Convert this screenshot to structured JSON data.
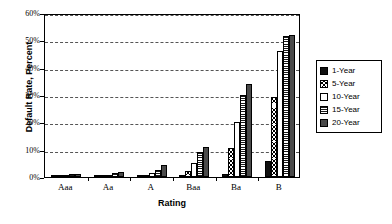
{
  "chart_data": {
    "type": "bar",
    "title": "",
    "xlabel": "Rating",
    "ylabel": "Default Rate, Percent",
    "categories": [
      "Aaa",
      "Aa",
      "A",
      "Baa",
      "Ba",
      "B"
    ],
    "ylim": [
      0,
      60
    ],
    "ytick_labels": [
      "0%",
      "10%",
      "20%",
      "30%",
      "40%",
      "50%",
      "60%"
    ],
    "ytick_values": [
      0,
      10,
      20,
      30,
      40,
      50,
      60
    ],
    "grid": "horizontal-dashed",
    "legend_position": "right",
    "series": [
      {
        "name": "1-Year",
        "pattern": "solid-black",
        "color": "#111111",
        "values": [
          0.0,
          0.0,
          0.1,
          0.2,
          1.2,
          5.8
        ]
      },
      {
        "name": "5-Year",
        "pattern": "cross-hatch",
        "color": "#ffffff",
        "values": [
          0.2,
          0.3,
          0.5,
          2.1,
          10.7,
          29.2
        ]
      },
      {
        "name": "10-Year",
        "pattern": "white",
        "color": "#ffffff",
        "values": [
          0.6,
          0.8,
          1.4,
          5.1,
          20.0,
          46.0
        ]
      },
      {
        "name": "15-Year",
        "pattern": "horizontal-lines",
        "color": "#1a1a1a",
        "values": [
          1.0,
          1.3,
          2.5,
          9.0,
          30.0,
          51.7
        ]
      },
      {
        "name": "20-Year",
        "pattern": "solid-gray",
        "color": "#4a4a4a",
        "values": [
          1.1,
          2.0,
          4.3,
          11.1,
          33.9,
          52.0
        ]
      }
    ]
  }
}
